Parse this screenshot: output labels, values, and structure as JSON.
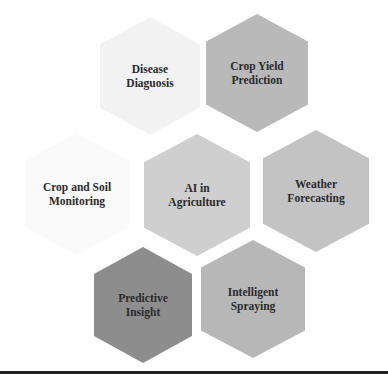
{
  "diagram": {
    "type": "hexagon-cluster",
    "center": "AI in Agriculture",
    "nodes": [
      {
        "id": "disease",
        "lines": [
          "Disease",
          "Diaguosis"
        ],
        "cx": 150,
        "cy": 76,
        "w": 100,
        "h": 118,
        "fill": "#f2f2f2"
      },
      {
        "id": "crop-yield",
        "lines": [
          "Crop Yield",
          "Prediction"
        ],
        "cx": 257,
        "cy": 73,
        "w": 102,
        "h": 118,
        "fill": "#b9b9b9"
      },
      {
        "id": "crop-soil",
        "lines": [
          "Crop and Soil",
          "Monitoring"
        ],
        "cx": 77,
        "cy": 194,
        "w": 104,
        "h": 122,
        "fill": "#fafafa"
      },
      {
        "id": "ai-agriculture",
        "lines": [
          "AI in",
          "Agriculture"
        ],
        "cx": 197,
        "cy": 195,
        "w": 106,
        "h": 122,
        "fill": "#cfcfcf"
      },
      {
        "id": "weather",
        "lines": [
          "Weather",
          "Forecasting"
        ],
        "cx": 316,
        "cy": 191,
        "w": 106,
        "h": 122,
        "fill": "#c3c3c3"
      },
      {
        "id": "predictive",
        "lines": [
          "Predictive",
          "Insight"
        ],
        "cx": 143,
        "cy": 305,
        "w": 98,
        "h": 116,
        "fill": "#8d8d8d"
      },
      {
        "id": "spraying",
        "lines": [
          "Intelligent",
          "Spraying"
        ],
        "cx": 253,
        "cy": 299,
        "w": 104,
        "h": 118,
        "fill": "#b7b7b7"
      }
    ]
  },
  "colors": {
    "text": "#2b2b2b",
    "rule": "#222222",
    "background": "#ffffff"
  }
}
